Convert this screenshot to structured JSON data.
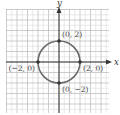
{
  "chart_data": {
    "type": "line",
    "title": "",
    "xlabel": "x",
    "ylabel": "y",
    "xlim": [
      -5,
      5
    ],
    "ylim": [
      -5,
      5
    ],
    "grid": true,
    "curve": {
      "name": "circle",
      "equation": "x^2 + y^2 = 4",
      "center": [
        0,
        0
      ],
      "radius": 2
    },
    "points": [
      {
        "x": 0,
        "y": 2,
        "label": "(0, 2)",
        "anchor": "top-right"
      },
      {
        "x": 2,
        "y": 0,
        "label": "(2, 0)",
        "anchor": "bottom-right"
      },
      {
        "x": -2,
        "y": 0,
        "label": "(−2, 0)",
        "anchor": "bottom-left"
      },
      {
        "x": 0,
        "y": -2,
        "label": "(0, −2)",
        "anchor": "bottom-right"
      }
    ]
  }
}
